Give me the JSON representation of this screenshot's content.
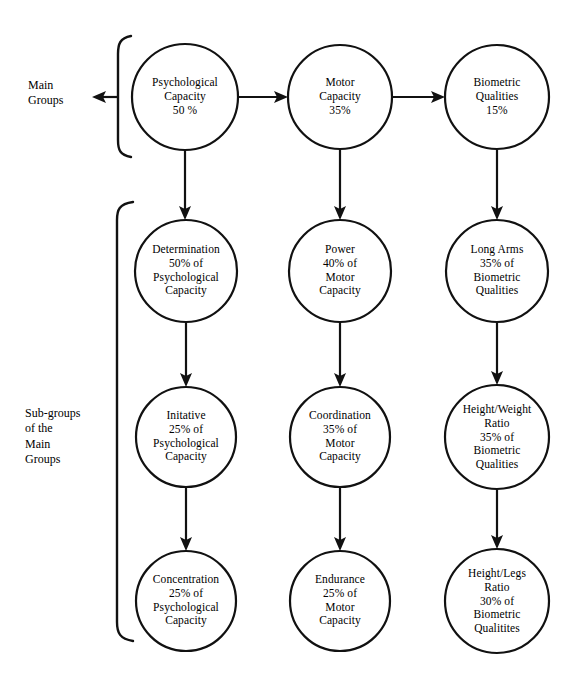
{
  "figure": {
    "canvas_width": 584,
    "canvas_height": 693,
    "background_color": "#ffffff",
    "stroke_color": "#111111"
  },
  "side_labels": [
    {
      "name": "main-groups-label",
      "lines": [
        "Main",
        "Groups"
      ],
      "x": 28,
      "y": 78
    },
    {
      "name": "sub-groups-label",
      "lines": [
        "Sub-groups",
        "of the",
        "Main",
        "Groups"
      ],
      "x": 25,
      "y": 406
    }
  ],
  "nodes": {
    "r1c1": {
      "lines": [
        "Psychological",
        "Capacity",
        "50 %"
      ],
      "cx": 185,
      "cy": 97,
      "r": 53
    },
    "r1c2": {
      "lines": [
        "Motor",
        "Capacity",
        "35%"
      ],
      "cx": 340,
      "cy": 97,
      "r": 52
    },
    "r1c3": {
      "lines": [
        "Biometric",
        "Qualities",
        "15%"
      ],
      "cx": 497,
      "cy": 97,
      "r": 52
    },
    "r2c1": {
      "lines": [
        "Determination",
        "50% of",
        "Psychological",
        "Capacity"
      ],
      "cx": 186,
      "cy": 271,
      "r": 51
    },
    "r2c2": {
      "lines": [
        "Power",
        "40% of",
        "Motor",
        "Capacity"
      ],
      "cx": 340,
      "cy": 271,
      "r": 51
    },
    "r2c3": {
      "lines": [
        "Long Arms",
        "35% of",
        "Biometric",
        "Qualities"
      ],
      "cx": 497,
      "cy": 271,
      "r": 51
    },
    "r3c1": {
      "lines": [
        "Initative",
        "25% of",
        "Psychological",
        "Capacity"
      ],
      "cx": 186,
      "cy": 437,
      "r": 50
    },
    "r3c2": {
      "lines": [
        "Coordination",
        "35% of",
        "Motor",
        "Capacity"
      ],
      "cx": 340,
      "cy": 437,
      "r": 50
    },
    "r3c3": {
      "lines": [
        "Height/Weight",
        "Ratio",
        "35% of",
        "Biometric",
        "Qualities"
      ],
      "cx": 497,
      "cy": 437,
      "r": 52
    },
    "r4c1": {
      "lines": [
        "Concentration",
        "25% of",
        "Psychological",
        "Capacity"
      ],
      "cx": 186,
      "cy": 601,
      "r": 50
    },
    "r4c2": {
      "lines": [
        "Endurance",
        "25% of",
        "Motor",
        "Capacity"
      ],
      "cx": 340,
      "cy": 601,
      "r": 50
    },
    "r4c3": {
      "lines": [
        "Height/Legs",
        "Ratio",
        "30% of",
        "Biometric",
        "Qualitites"
      ],
      "cx": 497,
      "cy": 601,
      "r": 52
    }
  },
  "chart_data": {
    "type": "diagram",
    "main_groups": [
      {
        "name": "Psychological Capacity",
        "share": "50 %",
        "value": 50
      },
      {
        "name": "Motor Capacity",
        "share": "35%",
        "value": 35
      },
      {
        "name": "Biometric Qualities",
        "share": "15%",
        "value": 15
      }
    ],
    "sub_groups": [
      {
        "parent": "Psychological Capacity",
        "name": "Determination",
        "share": "50% of Psychological Capacity",
        "value": 50
      },
      {
        "parent": "Psychological Capacity",
        "name": "Initative",
        "share": "25% of Psychological Capacity",
        "value": 25
      },
      {
        "parent": "Psychological Capacity",
        "name": "Concentration",
        "share": "25% of Psychological Capacity",
        "value": 25
      },
      {
        "parent": "Motor Capacity",
        "name": "Power",
        "share": "40% of Motor Capacity",
        "value": 40
      },
      {
        "parent": "Motor Capacity",
        "name": "Coordination",
        "share": "35% of Motor Capacity",
        "value": 35
      },
      {
        "parent": "Motor Capacity",
        "name": "Endurance",
        "share": "25% of Motor Capacity",
        "value": 25
      },
      {
        "parent": "Biometric Qualities",
        "name": "Long Arms",
        "share": "35% of Biometric Qualities",
        "value": 35
      },
      {
        "parent": "Biometric Qualities",
        "name": "Height/Weight Ratio",
        "share": "35% of Biometric Qualities",
        "value": 35
      },
      {
        "parent": "Biometric Qualities",
        "name": "Height/Legs Ratio",
        "share": "30% of Biometric Qualitites",
        "value": 30
      }
    ],
    "row_labels": [
      "Main Groups",
      "Sub-groups of the Main Groups"
    ]
  }
}
